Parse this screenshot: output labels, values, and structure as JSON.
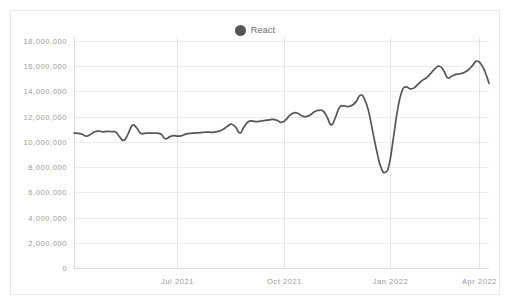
{
  "legend": {
    "position": "top-center",
    "items": [
      {
        "label": "React",
        "color": "#555555",
        "marker": "circle-marker-icon"
      }
    ]
  },
  "chart_data": {
    "type": "line",
    "title": "",
    "subtitle": "",
    "xlabel": "",
    "ylabel": "",
    "grid": true,
    "legend_position": "top-center",
    "ylim": [
      0,
      18000000
    ],
    "y_ticks": [
      0,
      2000000,
      4000000,
      6000000,
      8000000,
      10000000,
      12000000,
      14000000,
      16000000,
      18000000
    ],
    "y_tick_labels": [
      "0",
      "2,000,000",
      "4,000,000",
      "6,000,000",
      "8,000,000",
      "10,000,000",
      "12,000,000",
      "14,000,000",
      "16,000,000",
      "18,000,000"
    ],
    "x_tick_labels": [
      "Jul 2021",
      "Oct 2021",
      "Jan 2022",
      "Apr 2022"
    ],
    "x_tick_positions": [
      0.248,
      0.505,
      0.762,
      0.975
    ],
    "xlim_labels": [
      "",
      "Apr 2022"
    ],
    "series": [
      {
        "name": "React",
        "color": "#555555",
        "values": [
          10700000,
          10680000,
          10600000,
          10450000,
          10600000,
          10800000,
          10850000,
          10800000,
          10830000,
          10810000,
          10790000,
          10400000,
          10120000,
          10600000,
          11300000,
          11150000,
          10700000,
          10680000,
          10700000,
          10700000,
          10690000,
          10600000,
          10250000,
          10400000,
          10500000,
          10450000,
          10500000,
          10620000,
          10680000,
          10700000,
          10720000,
          10750000,
          10780000,
          10760000,
          10790000,
          10850000,
          11000000,
          11250000,
          11400000,
          11150000,
          10700000,
          11200000,
          11600000,
          11650000,
          11600000,
          11650000,
          11700000,
          11750000,
          11780000,
          11700000,
          11550000,
          11750000,
          12100000,
          12300000,
          12250000,
          12050000,
          12000000,
          12150000,
          12400000,
          12500000,
          12450000,
          11950000,
          11350000,
          11950000,
          12750000,
          12850000,
          12800000,
          12900000,
          13200000,
          13700000,
          13400000,
          12400000,
          10800000,
          9200000,
          7950000,
          7600000,
          8300000,
          10400000,
          12600000,
          14000000,
          14350000,
          14200000,
          14300000,
          14600000,
          14900000,
          15100000,
          15450000,
          15800000,
          16000000,
          15700000,
          15100000,
          15200000,
          15350000,
          15400000,
          15500000,
          15700000,
          16050000,
          16400000,
          16200000,
          15600000,
          14650000
        ]
      }
    ]
  }
}
